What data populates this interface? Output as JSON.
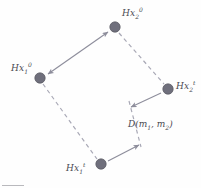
{
  "figure": {
    "type": "diagram",
    "background_color": "#fefefe",
    "node_color": "#6f6f7c",
    "node_edge_color": "#56565f",
    "line_color": "#8e8e9c",
    "dash_color": "#a9a9b6",
    "text_color": "#4a4a52",
    "nodes": [
      {
        "id": "hx2-0",
        "label_text": "Hx",
        "label_sub": "2",
        "label_sup": "0",
        "cx": 115,
        "cy": 27,
        "r": 5.2,
        "label_x": 122,
        "label_y": 11
      },
      {
        "id": "hx1-0",
        "label_text": "Hx",
        "label_sub": "1",
        "label_sup": "0",
        "cx": 40,
        "cy": 78,
        "r": 5.2,
        "label_x": 11,
        "label_y": 66
      },
      {
        "id": "hx2-t",
        "label_text": "Hx",
        "label_sub": "2",
        "label_sup": "t",
        "cx": 168,
        "cy": 89,
        "r": 5.2,
        "label_x": 176,
        "label_y": 84
      },
      {
        "id": "hx1-t",
        "label_text": "Hx",
        "label_sub": "1",
        "label_sup": "t",
        "cx": 101,
        "cy": 164,
        "r": 5.2,
        "label_x": 66,
        "label_y": 166
      }
    ],
    "dashed_edges": [
      {
        "id": "edge-hx2-0-to-hx2-t",
        "x1": 119,
        "y1": 33,
        "x2": 164,
        "y2": 84
      },
      {
        "id": "edge-hx1-0-to-hx1-t",
        "x1": 43,
        "y1": 84,
        "x2": 97,
        "y2": 159
      },
      {
        "id": "edge-distance-segment",
        "x1": 129,
        "y1": 102,
        "x2": 140,
        "y2": 146
      }
    ],
    "arrows": [
      {
        "id": "arrow-double-hx1-0-hx2-0",
        "style": "double-headed",
        "x1": 48,
        "y1": 74,
        "x2": 108,
        "y2": 32
      },
      {
        "id": "arrow-hx2-t-to-distance",
        "style": "single-headed",
        "x1": 161,
        "y1": 93,
        "x2": 130,
        "y2": 107
      },
      {
        "id": "arrow-hx1-t-to-distance",
        "style": "single-headed",
        "x1": 108,
        "y1": 161,
        "x2": 139,
        "y2": 144
      }
    ],
    "distance_label": {
      "prefix": "D(m",
      "sub1": "1",
      "mid": ", m",
      "sub2": "2",
      "suffix": ")",
      "x": 128,
      "y": 124
    }
  }
}
